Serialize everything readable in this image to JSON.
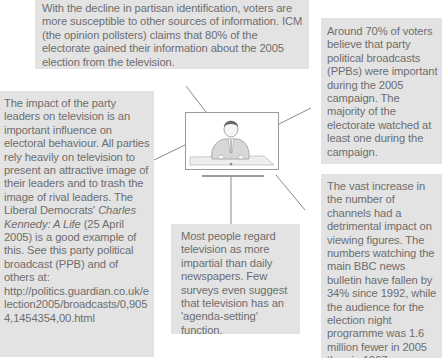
{
  "diagram": {
    "center": {
      "icon": "television-presenter-icon",
      "label": "Television"
    },
    "boxes": {
      "top": {
        "text": "With the decline in partisan identification, voters are more susceptible to other sources of information. ICM (the opinion pollsters) claims that 80% of the electorate gained their information about the 2005 election from the television."
      },
      "left": {
        "text_before_title": "The impact of the party leaders on television is an important influence on electoral behaviour. All parties rely heavily on television to present an attractive image of their leaders and to trash the image of rival leaders. The Liberal Democrats' ",
        "title": "Charles Kennedy: A Life",
        "text_after_title": " (25 April 2005) is a good example of this. See this party political broadcast (PPB) and of others at:",
        "url": "http://politics.guardian.co.uk/election2005/broadcasts/0,9054,1454354,00.html"
      },
      "right_top": {
        "text": "Around 70% of voters believe that party political broadcasts (PPBs) were important during the 2005 campaign. The majority of the electorate watched at least one during the campaign."
      },
      "right_bottom": {
        "text": "The vast increase in the number of channels had a detrimental impact on viewing figures. The numbers watching the main BBC news bulletin have fallen by 34% since 1992, while the audience for the election night programme was 1.6 million fewer in 2005 than in 1997."
      },
      "bottom": {
        "text": "Most people regard television as more impartial than daily newspapers. Few surveys even suggest that television has an 'agenda-setting' function."
      }
    },
    "colors": {
      "box_fill": "#e3e3e3",
      "text": "#6e6e6e",
      "connector": "#8a8a8a"
    }
  }
}
